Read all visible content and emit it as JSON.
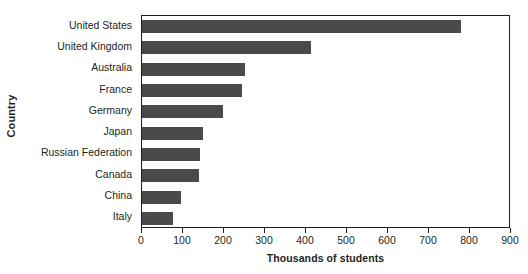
{
  "chart_data": {
    "type": "bar",
    "orientation": "horizontal",
    "title": "",
    "xlabel": "Thousands of students",
    "ylabel": "Country",
    "categories": [
      "United States",
      "United Kingdom",
      "Australia",
      "France",
      "Germany",
      "Japan",
      "Russian Federation",
      "Canada",
      "China",
      "Italy"
    ],
    "values": [
      778,
      412,
      251,
      244,
      198,
      149,
      141,
      139,
      95,
      76
    ],
    "xlim": [
      0,
      900
    ],
    "xticks": [
      0,
      100,
      200,
      300,
      400,
      500,
      600,
      700,
      800,
      900
    ],
    "xtick_labels": [
      "0",
      "100",
      "200",
      "300",
      "400",
      "500",
      "600",
      "700",
      "800",
      "900"
    ],
    "grid": false,
    "legend": false,
    "bar_color": "#4a4a4a",
    "axis_color": "#231f20"
  }
}
